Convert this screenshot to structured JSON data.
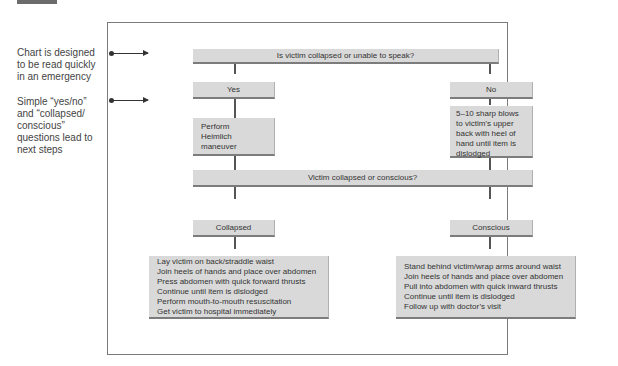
{
  "annotations": [
    {
      "text": "Chart is designed\nto be read quickly\nin an emergency"
    },
    {
      "text": "Simple “yes/no”\nand “collapsed/\nconscious”\nquestions lead to\nnext steps"
    }
  ],
  "flowchart": {
    "question_1": "Is victim collapsed or unable to speak?",
    "yes_label": "Yes",
    "no_label": "No",
    "yes_action": "Perform\nHeimlich\nmaneuver",
    "no_action": "5–10 sharp blows\nto victim’s upper\nback with heel of\nhand until item is\ndislodged",
    "question_2": "Victim collapsed or conscious?",
    "collapsed_label": "Collapsed",
    "conscious_label": "Conscious",
    "collapsed_steps": [
      "Lay victim on back/straddle waist",
      "Join heels of hands and place over abdomen",
      "Press abdomen with quick forward thrusts",
      "Continue until item is dislodged",
      "Perform mouth-to-mouth resuscitation",
      "Get victim to hospital immediately"
    ],
    "conscious_steps": [
      "Stand behind victim/wrap arms around waist",
      "Join heels of hands and place over abdomen",
      "Pull into abdomen with quick inward thrusts",
      "Continue until item is dislodged",
      "Follow up with doctor’s visit"
    ]
  },
  "colors": {
    "box_fill": "#d9d9d9",
    "box_shadow": "#7c7c7c",
    "connector": "#555555",
    "frame": "#7a7a7a",
    "text": "#333333"
  }
}
